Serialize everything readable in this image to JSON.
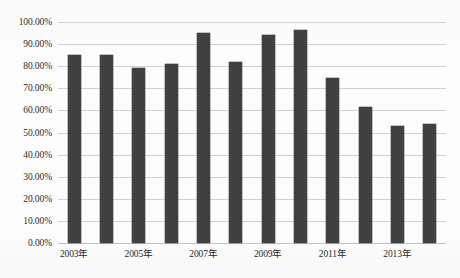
{
  "chart_data": {
    "type": "bar",
    "title": "",
    "xlabel": "",
    "ylabel": "",
    "grid": true,
    "legend": false,
    "ylim": [
      0,
      100
    ],
    "ytick_labels": [
      "100.00%",
      "90.00%",
      "80.00%",
      "70.00%",
      "60.00%",
      "50.00%",
      "40.00%",
      "30.00%",
      "20.00%",
      "10.00%",
      "0.00%"
    ],
    "ytick_values": [
      100,
      90,
      80,
      70,
      60,
      50,
      40,
      30,
      20,
      10,
      0
    ],
    "categories": [
      "2003年",
      "2004年",
      "2005年",
      "2006年",
      "2007年",
      "2008年",
      "2009年",
      "2010年",
      "2011年",
      "2012年",
      "2013年",
      "2014年"
    ],
    "xtick_labels": [
      "2003年",
      "2005年",
      "2007年",
      "2009年",
      "2011年",
      "2013年"
    ],
    "xtick_indices": [
      0,
      2,
      4,
      6,
      8,
      10
    ],
    "values": [
      85.0,
      85.0,
      79.0,
      81.0,
      95.0,
      82.0,
      94.0,
      96.5,
      74.5,
      61.5,
      53.0,
      54.0
    ],
    "bar_color": "#414141",
    "gridline_color": "#d2d2d2",
    "background_color": "#fdfdfd"
  }
}
